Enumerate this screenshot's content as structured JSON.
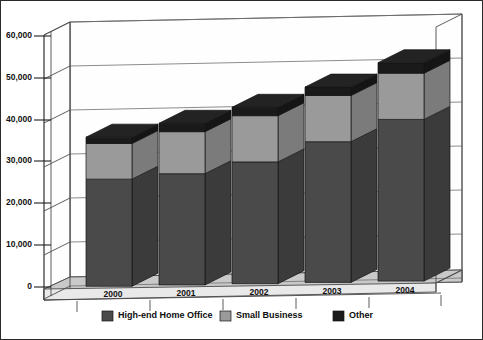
{
  "chart_data": {
    "type": "bar",
    "subtype": "stacked-column-3d",
    "title": "",
    "xlabel": "",
    "ylabel": "",
    "categories": [
      "2000",
      "2001",
      "2002",
      "2003",
      "2004"
    ],
    "series": [
      {
        "name": "High-end Home Office",
        "color": "#4a4a4a",
        "values": [
          25500,
          26500,
          29000,
          33500,
          38500
        ]
      },
      {
        "name": "Small Business",
        "color": "#9a9a9a",
        "values": [
          8500,
          10000,
          11000,
          11000,
          11000
        ]
      },
      {
        "name": "Other",
        "color": "#1a1a1a",
        "values": [
          1500,
          2000,
          2000,
          2000,
          2500
        ]
      }
    ],
    "totals": [
      35500,
      38500,
      42000,
      46500,
      52000
    ],
    "ylim": [
      0,
      60000
    ],
    "yticks": [
      0,
      10000,
      20000,
      30000,
      40000,
      50000,
      60000
    ],
    "ytick_labels": [
      "0",
      "10,000",
      "20,000",
      "30,000",
      "40,000",
      "50,000",
      "60,000"
    ],
    "grid": true,
    "legend_position": "bottom",
    "legend_entries": [
      {
        "label": "High-end Home Office",
        "color": "#4a4a4a"
      },
      {
        "label": "Small Business",
        "color": "#9a9a9a"
      },
      {
        "label": "Other",
        "color": "#1a1a1a"
      }
    ],
    "border": true,
    "background": "#ffffff"
  },
  "axis": {
    "y_labels": [
      "60,000",
      "50,000",
      "40,000",
      "30,000",
      "20,000",
      "10,000",
      "0"
    ],
    "x_labels": [
      "2000",
      "2001",
      "2002",
      "2003",
      "2004"
    ]
  },
  "legend": {
    "items": [
      {
        "label": "High-end Home Office"
      },
      {
        "label": "Small Business"
      },
      {
        "label": "Other"
      }
    ]
  }
}
